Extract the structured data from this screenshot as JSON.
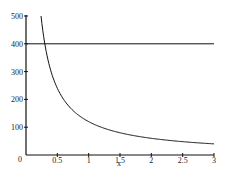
{
  "chart_data": {
    "type": "line",
    "title": "",
    "xlabel": "x",
    "ylabel": "",
    "xlim": [
      0,
      3
    ],
    "ylim": [
      0,
      500
    ],
    "grid": false,
    "legend": null,
    "x_ticks": [
      "0",
      "0.5",
      "1",
      "1.5",
      "2",
      "2.5",
      "3"
    ],
    "y_ticks": [
      "100",
      "200",
      "300",
      "400",
      "500"
    ],
    "series": [
      {
        "name": "y = 120/x",
        "x": [
          0.24,
          0.3,
          0.4,
          0.5,
          0.75,
          1,
          1.5,
          2,
          2.5,
          3
        ],
        "values": [
          500,
          400,
          300,
          240,
          160,
          120,
          80,
          60,
          48,
          40
        ]
      },
      {
        "name": "y = 400",
        "x": [
          0,
          3
        ],
        "values": [
          400,
          400
        ]
      }
    ]
  },
  "labels": {
    "xlabel": "x",
    "origin": "0",
    "xt": [
      "0.5",
      "1",
      "1.5",
      "2",
      "2.5",
      "3"
    ],
    "yt": [
      "100",
      "200",
      "300",
      "400",
      "500"
    ]
  }
}
